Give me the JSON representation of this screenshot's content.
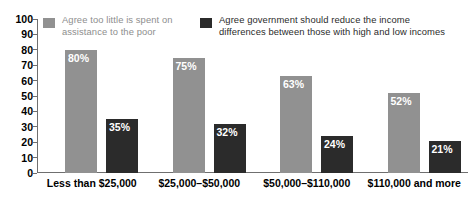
{
  "chart_data": {
    "type": "bar",
    "title": "",
    "subtitle": "",
    "xlabel": "",
    "ylabel": "",
    "ylim": [
      0,
      100
    ],
    "y_ticks": [
      0,
      10,
      20,
      30,
      40,
      50,
      60,
      70,
      80,
      90,
      100
    ],
    "grid": false,
    "legend_position": "top",
    "categories": [
      "Less than $25,000",
      "$25,000–$50,000",
      "$50,000–$110,000",
      "$110,000 and more"
    ],
    "series": [
      {
        "name": "Agree too little is spent on assistance to the poor",
        "color": "#919191",
        "values": [
          80,
          75,
          63,
          52
        ],
        "data_labels": [
          "80%",
          "75%",
          "63%",
          "52%"
        ]
      },
      {
        "name": "Agree government should reduce the income differences between those with high and low incomes",
        "color": "#2b2b2b",
        "values": [
          35,
          32,
          24,
          21
        ],
        "data_labels": [
          "35%",
          "32%",
          "24%",
          "21%"
        ]
      }
    ]
  },
  "legend": {
    "entries": [
      {
        "line1": "Agree too little is spent on",
        "line2": "assistance to the poor",
        "swatch_color": "#919191",
        "text_color": "#8e8e8e"
      },
      {
        "line1": "Agree government should reduce the income",
        "line2": "differences between those with high and low incomes",
        "swatch_color": "#2b2b2b",
        "text_color": "#2b2b2b"
      }
    ]
  },
  "axis": {
    "y_tick_labels": [
      "100",
      "90",
      "80",
      "70",
      "60",
      "50",
      "40",
      "30",
      "20",
      "10",
      "0"
    ],
    "axis_color": "#6f6f6f"
  }
}
